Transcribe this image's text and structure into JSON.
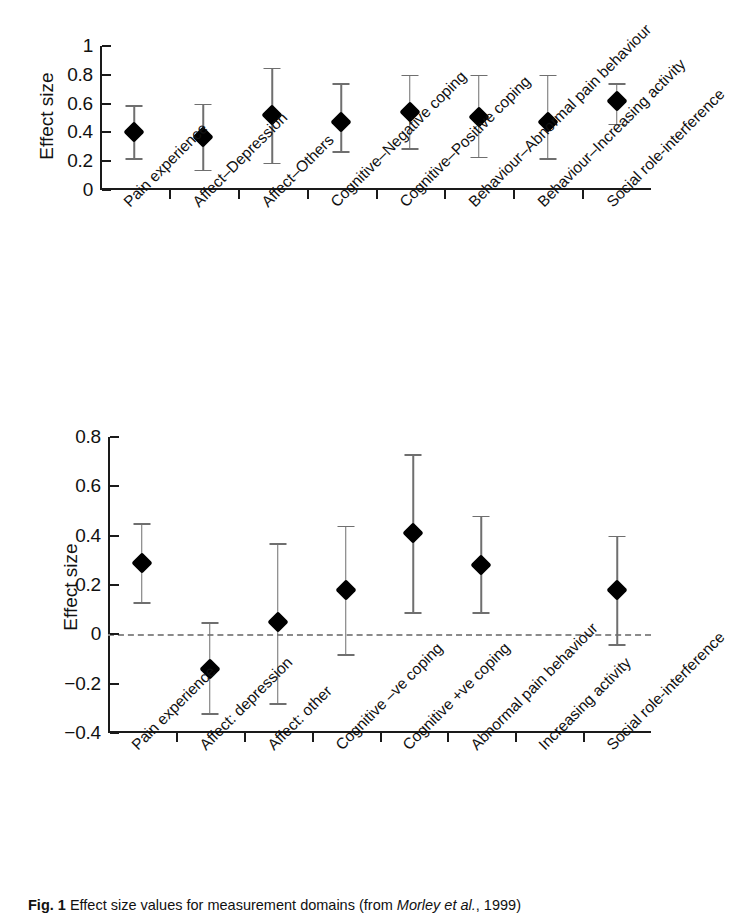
{
  "figure": {
    "caption_prefix": "Fig. 1",
    "caption_text": "Effect size values for measurement domains (from ",
    "caption_source": "Morley et al.",
    "caption_suffix": ", 1999)"
  },
  "chart_data": [
    {
      "type": "scatter",
      "panel": "top",
      "title": "",
      "xlabel": "",
      "ylabel": "Effect size",
      "ylim": [
        0,
        1
      ],
      "yticks": [
        0,
        0.2,
        0.4,
        0.6,
        0.8,
        1
      ],
      "ytick_labels": [
        "0",
        "0.2",
        "0.4",
        "0.6",
        "0.8",
        "1"
      ],
      "grid": false,
      "legend": "none",
      "error_bars": "95% confidence interval",
      "zero_line": false,
      "categories": [
        "Pain experience",
        "Affect–Depression",
        "Affect–Others",
        "Cognitive–Negative coping",
        "Cognitive–Positive coping",
        "Behaviour–Abnormal pain behaviour",
        "Behaviour–Increasing activity",
        "Social role-interference"
      ],
      "values": [
        0.4,
        0.37,
        0.52,
        0.47,
        0.54,
        0.51,
        0.47,
        0.62
      ],
      "ci_low": [
        0.22,
        0.14,
        0.19,
        0.27,
        0.29,
        0.23,
        0.22,
        0.46
      ],
      "ci_high": [
        0.59,
        0.6,
        0.85,
        0.74,
        0.8,
        0.8,
        0.8,
        0.74
      ]
    },
    {
      "type": "scatter",
      "panel": "bottom",
      "title": "",
      "xlabel": "",
      "ylabel": "Effect size",
      "ylim": [
        -0.4,
        0.8
      ],
      "yticks": [
        -0.4,
        -0.2,
        0,
        0.2,
        0.4,
        0.6,
        0.8
      ],
      "ytick_labels": [
        "−0.4",
        "−0.2",
        "0",
        "0.2",
        "0.4",
        "0.6",
        "0.8"
      ],
      "grid": false,
      "legend": "none",
      "error_bars": "95% confidence interval",
      "zero_line": true,
      "categories": [
        "Pain experience",
        "Affect: depression",
        "Affect: other",
        "Cognitive –ve coping",
        "Cognitive +ve coping",
        "Abnormal pain behaviour",
        "Increasing activity",
        "Social role-interference"
      ],
      "values": [
        0.29,
        -0.14,
        0.05,
        0.18,
        0.41,
        0.28,
        null,
        0.18
      ],
      "ci_low": [
        0.13,
        -0.32,
        -0.28,
        -0.08,
        0.09,
        0.09,
        null,
        -0.04
      ],
      "ci_high": [
        0.45,
        0.05,
        0.37,
        0.44,
        0.73,
        0.48,
        null,
        0.4
      ]
    }
  ]
}
